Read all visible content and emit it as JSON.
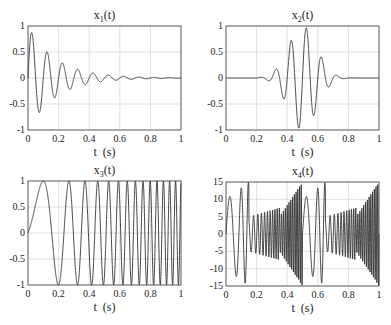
{
  "chart_data": [
    {
      "type": "line",
      "title": "x1(t)",
      "title_base": "x",
      "title_sub": "1",
      "title_tail": "(t)",
      "xlabel": "t  (s)",
      "ylabel": "",
      "xlim": [
        0,
        1
      ],
      "ylim": [
        -1,
        1
      ],
      "xticks": [
        "0",
        "0.2",
        "0.4",
        "0.6",
        "0.8",
        "1"
      ],
      "yticks": [
        "1",
        "0.5",
        "0",
        "-0.5",
        "-1"
      ],
      "grid": true,
      "description": "Exponentially damped sinusoid, ~10 Hz, peak ~0.9 at t≈0.025 decaying to ~0 by t=1",
      "signal": {
        "kind": "damped",
        "freq": 10,
        "decay": 5.5,
        "amp": 1.0
      },
      "key_points": [
        [
          0.025,
          0.88
        ],
        [
          0.075,
          -0.7
        ],
        [
          0.125,
          0.53
        ],
        [
          0.175,
          -0.42
        ],
        [
          0.225,
          0.32
        ],
        [
          0.275,
          -0.26
        ],
        [
          0.325,
          0.19
        ],
        [
          0.375,
          -0.16
        ],
        [
          0.425,
          0.12
        ],
        [
          0.525,
          0.07
        ],
        [
          0.625,
          0.04
        ],
        [
          0.725,
          0.02
        ],
        [
          1.0,
          0.0
        ]
      ]
    },
    {
      "type": "line",
      "title": "x2(t)",
      "title_base": "x",
      "title_sub": "2",
      "title_tail": "(t)",
      "xlabel": "t  (s)",
      "ylabel": "",
      "xlim": [
        0,
        1
      ],
      "ylim": [
        -1,
        1
      ],
      "xticks": [
        "0",
        "0.2",
        "0.4",
        "0.6",
        "0.8",
        "1"
      ],
      "yticks": [
        "1",
        "0.5",
        "0",
        "-0.5",
        "-1"
      ],
      "grid": true,
      "description": "Gaussian-windowed 10 Hz sinusoid centered near t=0.5, peak ~1.0",
      "signal": {
        "kind": "gauss",
        "freq": 10,
        "center": 0.5,
        "width": 0.13,
        "amp": 1.0
      },
      "key_points": [
        [
          0.225,
          0.22
        ],
        [
          0.275,
          -0.38
        ],
        [
          0.325,
          0.55
        ],
        [
          0.375,
          -0.75
        ],
        [
          0.425,
          0.9
        ],
        [
          0.475,
          -1.0
        ],
        [
          0.525,
          1.0
        ],
        [
          0.575,
          -0.9
        ],
        [
          0.625,
          0.73
        ],
        [
          0.675,
          -0.55
        ],
        [
          0.725,
          0.36
        ],
        [
          0.775,
          -0.25
        ],
        [
          0.825,
          0.12
        ]
      ]
    },
    {
      "type": "line",
      "title": "x3(t)",
      "title_base": "x",
      "title_sub": "3",
      "title_tail": "(t)",
      "xlabel": "t  (s)",
      "ylabel": "",
      "xlim": [
        0,
        1
      ],
      "ylim": [
        -1,
        1
      ],
      "xticks": [
        "0",
        "0.2",
        "0.4",
        "0.6",
        "0.8",
        "1"
      ],
      "yticks": [
        "1",
        "0.5",
        "0",
        "-0.5",
        "-1"
      ],
      "grid": true,
      "description": "Linear chirp, unit amplitude, frequency increasing from 0 to ~28 Hz",
      "signal": {
        "kind": "chirp",
        "rate": 28,
        "amp": 1.0
      },
      "key_points": [
        [
          0.0,
          0.0
        ],
        [
          0.16,
          1.0
        ],
        [
          0.27,
          -1.0
        ],
        [
          0.35,
          1.0
        ],
        [
          0.42,
          -1.0
        ],
        [
          0.48,
          1.0
        ],
        [
          0.53,
          -1.0
        ],
        [
          0.58,
          1.0
        ]
      ]
    },
    {
      "type": "line",
      "title": "x4(t)",
      "title_base": "x",
      "title_sub": "4",
      "title_tail": "(t)",
      "xlabel": "t  (s)",
      "ylabel": "",
      "xlim": [
        0,
        1
      ],
      "ylim": [
        -15,
        15
      ],
      "xticks": [
        "0",
        "0.2",
        "0.4",
        "0.6",
        "0.8",
        "1"
      ],
      "yticks": [
        "15",
        "10",
        "5",
        "0",
        "-5",
        "-10",
        "-15"
      ],
      "grid": true,
      "description": "Periodic (period ~0.5 s) chirp-like oscillation with amplitude ramp from ~5 to ~15 and dense oscillations, slowing near t≈0.2 and t≈0.7",
      "signal": {
        "kind": "x4",
        "period": 0.5
      },
      "key_points": [
        [
          0.0,
          10
        ],
        [
          0.14,
          15
        ],
        [
          0.2,
          12.5
        ],
        [
          0.29,
          -7.5
        ],
        [
          0.33,
          5.5
        ],
        [
          0.35,
          -5
        ],
        [
          0.6,
          15
        ],
        [
          0.7,
          12.5
        ],
        [
          0.79,
          -7.5
        ],
        [
          0.84,
          5.5
        ],
        [
          1.0,
          10
        ]
      ]
    }
  ]
}
